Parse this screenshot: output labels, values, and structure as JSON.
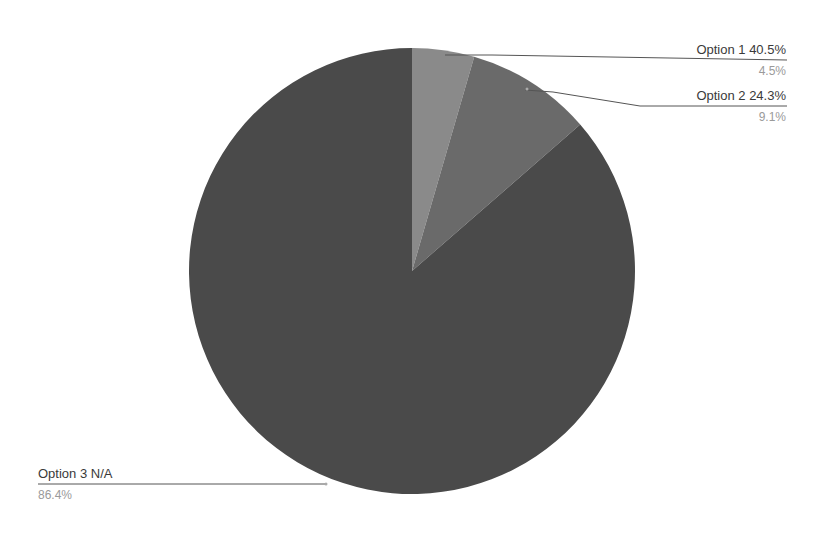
{
  "chart_data": {
    "type": "pie",
    "title": "",
    "start_angle_deg": 0,
    "direction": "clockwise",
    "slices": [
      {
        "name": "Option 1",
        "label": "Option 1 40.5%",
        "value": 4.5,
        "percent_label": "4.5%",
        "color": "#8a8a8a"
      },
      {
        "name": "Option 2",
        "label": "Option 2 24.3%",
        "value": 9.1,
        "percent_label": "9.1%",
        "color": "#6a6a6a"
      },
      {
        "name": "Option 3",
        "label": "Option 3 N/A",
        "value": 86.4,
        "percent_label": "86.4%",
        "color": "#4a4a4a"
      }
    ],
    "legend": "none",
    "labels": "outside with leader lines"
  },
  "labels": {
    "opt1_main": "Option 1 40.5%",
    "opt1_sub": "4.5%",
    "opt2_main": "Option 2 24.3%",
    "opt2_sub": "9.1%",
    "opt3_main": "Option 3 N/A",
    "opt3_sub": "86.4%"
  }
}
